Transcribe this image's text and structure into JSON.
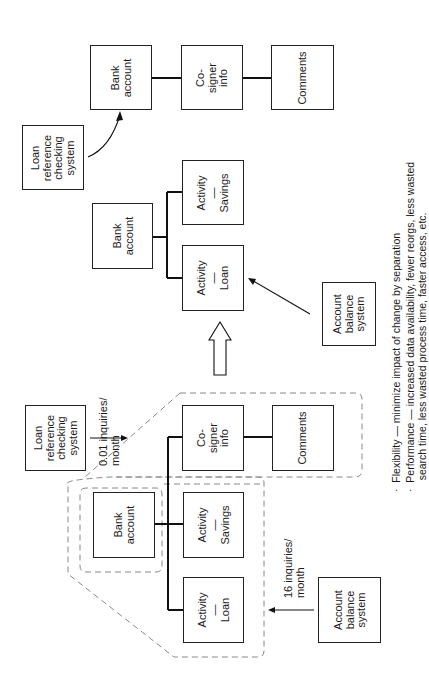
{
  "diagram": {
    "orientation": "rotated-90-ccw",
    "before": {
      "boxes": {
        "loan_ref": "Loan\nreference\nchecking\nsystem",
        "bank_account": "Bank\naccount",
        "cosigner": "Co-\nsigner\ninfo",
        "activity_savings": "Activity\n—\nSavings",
        "activity_loan": "Activity\n—\nLoan",
        "comments": "Comments",
        "account_balance": "Account\nbalance\nsystem"
      },
      "labels": {
        "loan_ref_rate": "0.01 inquiries/\nmonth",
        "balance_rate": "16 inquiries/\nmonth"
      }
    },
    "after": {
      "loan_side": {
        "loan_ref": "Loan\nreference\nchecking\nsystem",
        "bank_account": "Bank\naccount",
        "cosigner": "Co-\nsigner\ninfo",
        "comments": "Comments"
      },
      "balance_side": {
        "bank_account": "Bank\naccount",
        "activity_savings": "Activity\n—\nSavings",
        "activity_loan": "Activity\n—\nLoan",
        "account_balance": "Account\nbalance\nsystem"
      }
    },
    "notes": [
      "·  Flexibility — minimize impact of change by separation",
      "·  Performance — increased data availability, fewer reorgs, less wasted\n    search time, less wasted process time, faster access, etc."
    ]
  }
}
